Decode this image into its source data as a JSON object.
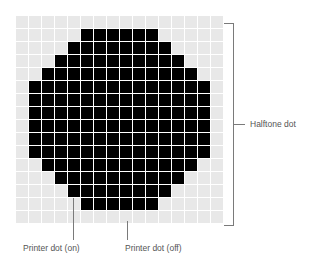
{
  "diagram": {
    "grid": {
      "columns": 16,
      "rows": 16,
      "cell_size_px": 13,
      "on_color": "#000000",
      "off_color": "#e8e8e8",
      "on_ranges_by_row": [
        null,
        [
          5,
          10
        ],
        [
          4,
          11
        ],
        [
          3,
          12
        ],
        [
          2,
          13
        ],
        [
          1,
          14
        ],
        [
          1,
          14
        ],
        [
          1,
          14
        ],
        [
          1,
          14
        ],
        [
          1,
          14
        ],
        [
          1,
          14
        ],
        [
          2,
          13
        ],
        [
          3,
          12
        ],
        [
          4,
          11
        ],
        [
          5,
          10
        ],
        null
      ]
    },
    "labels": {
      "halftone_dot": "Halftone dot",
      "printer_dot_on": "Printer dot (on)",
      "printer_dot_off": "Printer dot (off)"
    },
    "colors": {
      "label_text": "#555555",
      "leader_line": "#7a7a7a"
    }
  }
}
